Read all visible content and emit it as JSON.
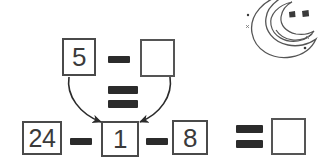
{
  "worksheet": {
    "background_color": "#ffffff",
    "ink_color": "#3a3a3a",
    "box_border_color": "#4a4a4a",
    "operator_color": "#2b2b2b",
    "top_row": {
      "operand_1": "5",
      "operator": "-",
      "operand_2": "",
      "operand_2_is_blank": true
    },
    "middle_equals": {
      "symbol": "="
    },
    "bottom_row": {
      "operand_1": "24",
      "operator_1": "-",
      "operand_2": "1",
      "operator_2": "-",
      "operand_3": "8",
      "equals": "=",
      "result": "",
      "result_is_blank": true
    },
    "arrows": {
      "count": 2,
      "description": "curved arrows from top row boxes down to the box containing 1",
      "left_arrow_from": "5",
      "left_arrow_to": "1",
      "right_arrow_from": "",
      "right_arrow_to": "1"
    },
    "decoration": {
      "name": "smiling-crescent-moon",
      "eyes": 2,
      "has_smile": true,
      "sparkles": 2,
      "dots": 2
    }
  }
}
